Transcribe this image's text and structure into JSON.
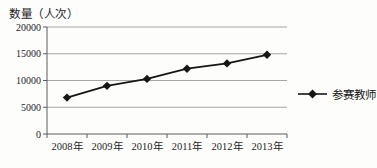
{
  "chart_data": {
    "type": "line",
    "title": "",
    "ylabel": "数量（人次）",
    "xlabel": "",
    "categories": [
      "2008年",
      "2009年",
      "2010年",
      "2011年",
      "2012年",
      "2013年"
    ],
    "series": [
      {
        "name": "参赛教师",
        "values": [
          6800,
          9000,
          10300,
          12200,
          13200,
          14800
        ]
      }
    ],
    "ylim": [
      0,
      20000
    ],
    "y_ticks": [
      0,
      5000,
      10000,
      15000,
      20000
    ],
    "grid": true,
    "legend_position": "right",
    "marker": "diamond",
    "line_color": "#161616",
    "grid_color": "#a6a6a6",
    "axis_color": "#5c5c5c",
    "text_color": "#1e1e1e",
    "background_color": "#fdfdfc"
  }
}
